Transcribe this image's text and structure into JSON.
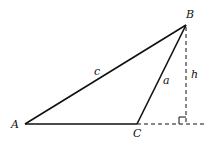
{
  "diagram": {
    "type": "triangle-with-altitude",
    "vertices": {
      "A": {
        "label": "A",
        "x": 25,
        "y": 124
      },
      "B": {
        "label": "B",
        "x": 186,
        "y": 25
      },
      "C": {
        "label": "C",
        "x": 137,
        "y": 124
      }
    },
    "sides": {
      "c": {
        "label": "c",
        "from": "A",
        "to": "B"
      },
      "a": {
        "label": "a",
        "from": "C",
        "to": "B"
      }
    },
    "altitude": {
      "label": "h",
      "from": "B",
      "foot_x": 186,
      "foot_y": 124
    },
    "extension_end_x": 207,
    "colors": {
      "stroke": "#111111",
      "background": "#ffffff"
    }
  }
}
